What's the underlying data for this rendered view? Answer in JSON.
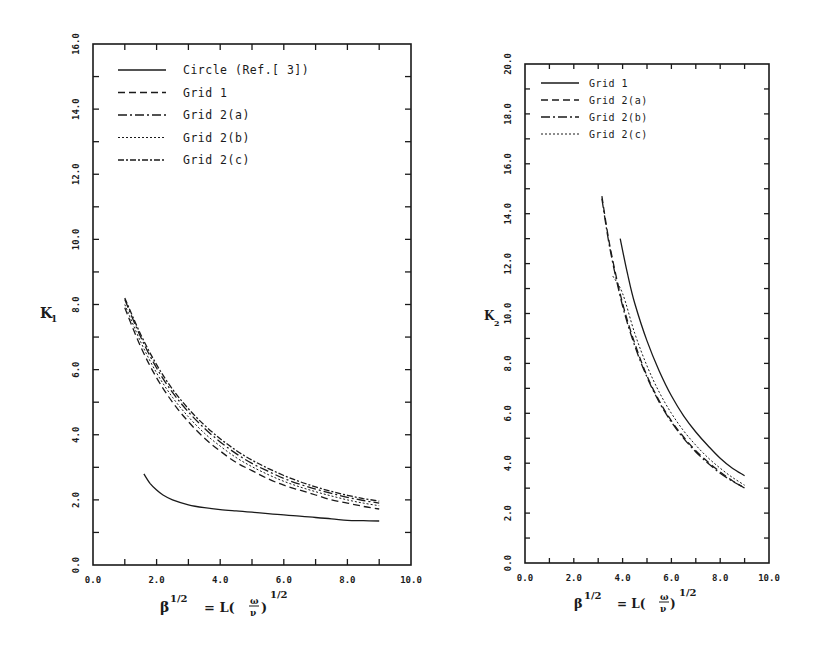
{
  "chart_data": [
    {
      "type": "line",
      "id": "left",
      "title": "",
      "xlabel": "β^{1/2} = L(ω/ν)^{1/2}",
      "ylabel": "K_1",
      "xlim": [
        0,
        10
      ],
      "ylim": [
        0,
        16
      ],
      "x_tick_labels": [
        "0.0",
        "2.0",
        "4.0",
        "6.0",
        "8.0",
        "10.0"
      ],
      "x_tick_values": [
        0,
        2,
        4,
        6,
        8,
        10
      ],
      "x_minor_ticks": [
        1,
        3,
        5,
        7,
        9
      ],
      "y_tick_labels": [
        "0.0",
        "2.0",
        "4.0",
        "6.0",
        "8.0",
        "10.0",
        "12.0",
        "14.0",
        "16.0"
      ],
      "y_tick_values": [
        0,
        2,
        4,
        6,
        8,
        10,
        12,
        14,
        16
      ],
      "y_minor_ticks": [
        1,
        3,
        5,
        7,
        9,
        11,
        13,
        15
      ],
      "grid": false,
      "legend_position": "upper-left",
      "series": [
        {
          "name": "Circle (Ref.[ 3])",
          "style": "solid",
          "x": [
            1.6,
            1.8,
            2.0,
            2.2,
            2.5,
            3.0,
            3.5,
            4.0,
            4.5,
            5.0,
            5.5,
            6.0,
            6.5,
            7.0,
            7.5,
            8.0,
            8.5,
            9.0
          ],
          "y": [
            2.8,
            2.5,
            2.3,
            2.15,
            2.0,
            1.85,
            1.76,
            1.7,
            1.66,
            1.62,
            1.58,
            1.54,
            1.5,
            1.46,
            1.42,
            1.37,
            1.36,
            1.35
          ]
        },
        {
          "name": "Grid 1",
          "style": "dashed",
          "x": [
            1.0,
            1.5,
            2.0,
            2.5,
            3.0,
            3.5,
            4.0,
            4.5,
            5.0,
            5.5,
            6.0,
            6.5,
            7.0,
            7.5,
            8.0,
            8.5,
            9.0
          ],
          "y": [
            7.9,
            6.7,
            5.75,
            5.0,
            4.4,
            3.9,
            3.5,
            3.15,
            2.9,
            2.65,
            2.45,
            2.3,
            2.15,
            2.0,
            1.9,
            1.8,
            1.72
          ]
        },
        {
          "name": "Grid 2(a)",
          "style": "dashdot",
          "x": [
            1.0,
            1.5,
            2.0,
            2.5,
            3.0,
            3.5,
            4.0,
            4.5,
            5.0,
            5.5,
            6.0,
            6.5,
            7.0,
            7.5,
            8.0,
            8.5,
            9.0
          ],
          "y": [
            8.15,
            7.0,
            6.05,
            5.3,
            4.7,
            4.2,
            3.78,
            3.42,
            3.12,
            2.88,
            2.66,
            2.48,
            2.33,
            2.2,
            2.08,
            1.98,
            1.9
          ]
        },
        {
          "name": "Grid 2(b)",
          "style": "dotted",
          "x": [
            1.0,
            1.5,
            2.0,
            2.5,
            3.0,
            3.5,
            4.0,
            4.5,
            5.0,
            5.5,
            6.0,
            6.5,
            7.0,
            7.5,
            8.0,
            8.5,
            9.0
          ],
          "y": [
            8.0,
            6.85,
            5.9,
            5.15,
            4.55,
            4.05,
            3.65,
            3.3,
            3.02,
            2.78,
            2.57,
            2.4,
            2.25,
            2.12,
            2.0,
            1.9,
            1.82
          ]
        },
        {
          "name": "Grid 2(c)",
          "style": "longdash-dot",
          "x": [
            1.0,
            1.5,
            2.0,
            2.5,
            3.0,
            3.5,
            4.0,
            4.5,
            5.0,
            5.5,
            6.0,
            6.5,
            7.0,
            7.5,
            8.0,
            8.5,
            9.0
          ],
          "y": [
            8.2,
            7.08,
            6.15,
            5.4,
            4.8,
            4.3,
            3.88,
            3.52,
            3.22,
            2.97,
            2.75,
            2.56,
            2.4,
            2.26,
            2.14,
            2.04,
            1.96
          ]
        }
      ]
    },
    {
      "type": "line",
      "id": "right",
      "title": "",
      "xlabel": "β^{1/2} = L(ω/ν)^{1/2}",
      "ylabel": "K_2",
      "xlim": [
        0,
        10
      ],
      "ylim": [
        0,
        20
      ],
      "x_tick_labels": [
        "0.0",
        "2.0",
        "4.0",
        "6.0",
        "8.0",
        "10.0"
      ],
      "x_tick_values": [
        0,
        2,
        4,
        6,
        8,
        10
      ],
      "x_minor_ticks": [
        1,
        3,
        5,
        7,
        9
      ],
      "y_tick_labels": [
        "0.0",
        "2.0",
        "4.0",
        "6.0",
        "8.0",
        "10.0",
        "12.0",
        "14.0",
        "16.0",
        "18.0",
        "20.0"
      ],
      "y_tick_values": [
        0,
        2,
        4,
        6,
        8,
        10,
        12,
        14,
        16,
        18,
        20
      ],
      "y_minor_ticks": [
        1,
        3,
        5,
        7,
        9,
        11,
        13,
        15,
        17,
        19
      ],
      "grid": false,
      "legend_position": "upper-left",
      "series": [
        {
          "name": "Grid 1",
          "style": "solid",
          "x": [
            3.9,
            4.2,
            4.5,
            5.0,
            5.5,
            6.0,
            6.5,
            7.0,
            7.5,
            8.0,
            8.5,
            9.0
          ],
          "y": [
            13.0,
            11.6,
            10.4,
            8.9,
            7.7,
            6.7,
            5.9,
            5.25,
            4.7,
            4.2,
            3.8,
            3.5
          ]
        },
        {
          "name": "Grid 2(a)",
          "style": "dashed",
          "x": [
            3.15,
            3.5,
            4.0,
            4.5,
            5.0,
            5.5,
            6.0,
            6.5,
            7.0,
            7.5,
            8.0,
            8.5,
            9.0
          ],
          "y": [
            14.7,
            12.6,
            10.4,
            8.8,
            7.5,
            6.5,
            5.7,
            5.05,
            4.5,
            4.05,
            3.65,
            3.3,
            3.0
          ]
        },
        {
          "name": "Grid 2(b)",
          "style": "dashdot",
          "x": [
            3.15,
            3.5,
            4.0,
            4.5,
            5.0,
            5.5,
            6.0,
            6.5,
            7.0,
            7.5,
            8.0,
            8.5,
            9.0
          ],
          "y": [
            14.6,
            12.5,
            10.3,
            8.7,
            7.45,
            6.45,
            5.65,
            5.0,
            4.45,
            4.0,
            3.6,
            3.28,
            3.02
          ]
        },
        {
          "name": "Grid 2(c)",
          "style": "dotted",
          "x": [
            3.6,
            4.0,
            4.5,
            5.0,
            5.5,
            6.0,
            6.5,
            7.0,
            7.5,
            8.0,
            8.5,
            9.0
          ],
          "y": [
            11.5,
            10.8,
            9.2,
            7.9,
            6.85,
            6.0,
            5.3,
            4.72,
            4.22,
            3.8,
            3.43,
            3.12
          ]
        }
      ]
    }
  ],
  "left_panel": {
    "ylabel_main": "K",
    "ylabel_sub": "1",
    "xlabel_beta": "β",
    "xlabel_exp": "1/2",
    "xlabel_eq": "= L(",
    "xlabel_num": "ω",
    "xlabel_den": "ν",
    "xlabel_close": ")",
    "xlabel_exp2": "1/2"
  },
  "right_panel": {
    "ylabel_main": "K",
    "ylabel_sub": "2",
    "xlabel_beta": "β",
    "xlabel_exp": "1/2",
    "xlabel_eq": "= L(",
    "xlabel_num": "ω",
    "xlabel_den": "ν",
    "xlabel_close": ")",
    "xlabel_exp2": "1/2"
  },
  "colors": {
    "ink": "#1a1a1a",
    "background": "#ffffff"
  }
}
